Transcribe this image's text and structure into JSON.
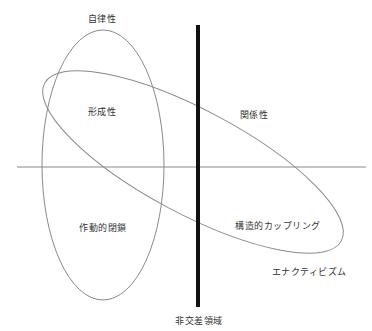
{
  "diagram": {
    "colors": {
      "background": "#ffffff",
      "outline": "#8a8a8a",
      "axis": "#8a8a8a",
      "divider": "#111111",
      "text": "#333333"
    },
    "shapes": {
      "vertical_ellipse": {
        "cx": 103,
        "cy": 165,
        "rx": 61,
        "ry": 135
      },
      "tilted_ellipse": {
        "cx": 193,
        "cy": 162,
        "rx": 168,
        "ry": 52,
        "rotate_deg": 28
      },
      "horizontal_axis": {
        "x1": 17,
        "y1": 167,
        "x2": 366,
        "y2": 167
      },
      "vertical_divider": {
        "x1": 198,
        "y1": 25,
        "x2": 198,
        "y2": 307,
        "width": 4
      }
    },
    "labels": {
      "autonomy": "自律性",
      "formation": "形成性",
      "relationality": "関係性",
      "operational_closure": "作動的閉鎖",
      "structural_coupling": "構造的カップリング",
      "enactivism": "エナクティビズム",
      "non_intersecting_area": "非交差領域"
    }
  }
}
